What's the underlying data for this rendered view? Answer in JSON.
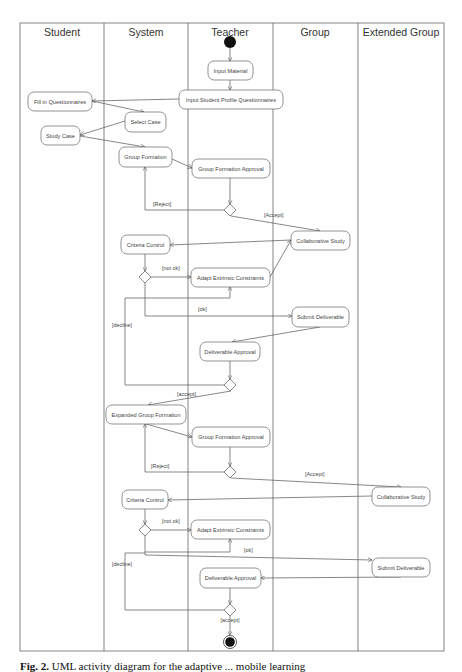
{
  "lanes": [
    {
      "id": "student",
      "title": "Student"
    },
    {
      "id": "system",
      "title": "System"
    },
    {
      "id": "teacher",
      "title": "Teacher"
    },
    {
      "id": "group",
      "title": "Group"
    },
    {
      "id": "extended",
      "title": "Extended Group"
    }
  ],
  "activities": [
    {
      "id": "input-material",
      "label": "Input Material",
      "lane": "teacher"
    },
    {
      "id": "input-questionnaires",
      "label": "Input Student Profile Questionnaires",
      "lane": "teacher"
    },
    {
      "id": "fill-questionnaires",
      "label": "Fill in Questionnaires",
      "lane": "student"
    },
    {
      "id": "select-case",
      "label": "Select Case",
      "lane": "system"
    },
    {
      "id": "study-case",
      "label": "Study Case",
      "lane": "student"
    },
    {
      "id": "group-formation",
      "label": "Group Formation",
      "lane": "system"
    },
    {
      "id": "group-formation-approval-1",
      "label": "Group Formation Approval",
      "lane": "teacher"
    },
    {
      "id": "collaborative-study-1",
      "label": "Collaborative Study",
      "lane": "group"
    },
    {
      "id": "criteria-control-1",
      "label": "Criteria Control",
      "lane": "system"
    },
    {
      "id": "adapt-constraints-1",
      "label": "Adapt Extrinsic Constraints",
      "lane": "teacher"
    },
    {
      "id": "submit-deliverable-1",
      "label": "Submit Deliverable",
      "lane": "group"
    },
    {
      "id": "deliverable-approval-1",
      "label": "Deliverable Approval",
      "lane": "teacher"
    },
    {
      "id": "expanded-group-formation",
      "label": "Expanded Group Formation",
      "lane": "system"
    },
    {
      "id": "group-formation-approval-2",
      "label": "Group Formation Approval",
      "lane": "teacher"
    },
    {
      "id": "collaborative-study-2",
      "label": "Collaborative Study",
      "lane": "extended"
    },
    {
      "id": "criteria-control-2",
      "label": "Criteria Control",
      "lane": "system"
    },
    {
      "id": "adapt-constraints-2",
      "label": "Adapt Extrinsic Constraints",
      "lane": "teacher"
    },
    {
      "id": "submit-deliverable-2",
      "label": "Submit Deliverable",
      "lane": "extended"
    },
    {
      "id": "deliverable-approval-2",
      "label": "Deliverable Approval",
      "lane": "teacher"
    }
  ],
  "guards": {
    "reject_1": "[Reject]",
    "accept_1": "[Accept]",
    "not_ok_1": "[not ok]",
    "ok_1": "[ok]",
    "decline_1": "[decline]",
    "accept_2": "[accept]",
    "reject_2": "[Reject]",
    "accept_3": "[Accept]",
    "not_ok_2": "[not ok]",
    "ok_2": "[ok]",
    "decline_2": "[decline]",
    "accept_4": "[accept]"
  },
  "caption": {
    "label": "Fig. 2.",
    "text": "UML activity diagram for the adaptive ... mobile learning"
  }
}
